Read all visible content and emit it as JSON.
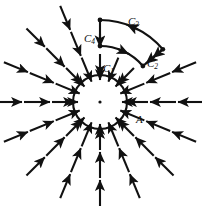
{
  "figure": {
    "type": "vector-field-diagram",
    "width": 202,
    "height": 206,
    "background_color": "#ffffff",
    "stroke_color": "#111111"
  },
  "labels": {
    "c1": {
      "base": "C",
      "sub": "1"
    },
    "c2": {
      "base": "C",
      "sub": "2"
    },
    "c3": {
      "base": "C",
      "sub": "3"
    },
    "c4": {
      "base": "C",
      "sub": "4"
    },
    "region_a": "A"
  },
  "chart_data": {
    "type": "scatter",
    "title": "",
    "xlabel": "",
    "ylabel": "",
    "grid": false,
    "legend": null,
    "field": {
      "kind": "radial-inward",
      "center": [
        100,
        102
      ],
      "arrow_color": "#111111",
      "ring_radii": [
        48,
        76,
        104
      ],
      "ring_counts": [
        16,
        16,
        16
      ],
      "arrow_length": 26,
      "note": "All arrows point toward the center"
    },
    "circle": {
      "label": "A",
      "center": [
        100,
        102
      ],
      "radius": 27,
      "center_dot_radius": 1.6
    },
    "contour": {
      "kind": "annular-sector",
      "center": [
        100,
        102
      ],
      "inner_radius": 56,
      "outer_radius": 82,
      "start_angle_deg": -90,
      "end_angle_deg": -40,
      "segments": [
        {
          "name": "C1",
          "role": "inner-arc",
          "direction": "counterclockwise-outward"
        },
        {
          "name": "C2",
          "role": "radial-outer-end",
          "direction": "inward"
        },
        {
          "name": "C3",
          "role": "outer-arc",
          "direction": "back-toward-start"
        },
        {
          "name": "C4",
          "role": "radial-start-end",
          "direction": "inward"
        }
      ]
    }
  }
}
